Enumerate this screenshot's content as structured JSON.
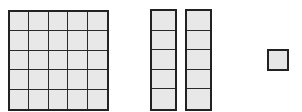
{
  "diagram": {
    "type": "base-ten-blocks",
    "blocks": [
      {
        "kind": "hundred-flat",
        "rows": 5,
        "cols": 5,
        "count": 1
      },
      {
        "kind": "rod",
        "rows": 5,
        "cols": 1,
        "count": 2
      },
      {
        "kind": "unit",
        "rows": 1,
        "cols": 1,
        "count": 1
      }
    ],
    "colors": {
      "border": "#222222",
      "fill": "#e6e6e6",
      "background": "#ffffff"
    }
  }
}
